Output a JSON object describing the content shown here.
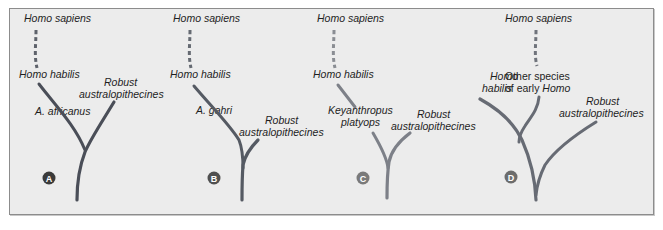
{
  "figure": {
    "panels": [
      {
        "id": "A",
        "badge": "A",
        "badge_color": "#3a3a3a",
        "line_color": "#4a4e58",
        "labels": {
          "top": "Homo sapiens",
          "habilis": "Homo habilis",
          "ancestor": "A. africanus",
          "robust_line1": "Robust",
          "robust_line2": "australopithecines"
        }
      },
      {
        "id": "B",
        "badge": "B",
        "badge_color": "#505050",
        "line_color": "#555a63",
        "labels": {
          "top": "Homo sapiens",
          "habilis": "Homo habilis",
          "ancestor": "A. gahri",
          "robust_line1": "Robust",
          "robust_line2": "australopithecines"
        }
      },
      {
        "id": "C",
        "badge": "C",
        "badge_color": "#7a7a7a",
        "line_color": "#7d8088",
        "labels": {
          "top": "Homo sapiens",
          "habilis": "Homo habilis",
          "ancestor_line1": "Keyanthropus",
          "ancestor_line2": "platyops",
          "robust_line1": "Robust",
          "robust_line2": "australopithecines"
        }
      },
      {
        "id": "D",
        "badge": "D",
        "badge_color": "#6c6c6c",
        "line_color": "#676b74",
        "labels": {
          "top": "Homo sapiens",
          "habilis_line1": "Homo",
          "habilis_line2": "habilis",
          "other_line1": "Other species",
          "other_line2_roman": "of early ",
          "other_line2_italic": "Homo",
          "robust_line1": "Robust",
          "robust_line2": "australopithecines"
        }
      }
    ]
  }
}
